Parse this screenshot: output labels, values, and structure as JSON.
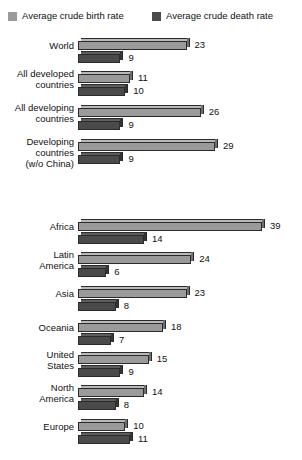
{
  "legend": {
    "items": [
      {
        "label": "Average crude birth rate",
        "color": "#9a9a9a",
        "key": "birth"
      },
      {
        "label": "Average crude death rate",
        "color": "#4a4a4a",
        "key": "death"
      }
    ]
  },
  "chart_data": {
    "type": "bar",
    "orientation": "horizontal",
    "title": "",
    "xlabel": "",
    "ylabel": "",
    "xlim": [
      0,
      39
    ],
    "grid": false,
    "legend_position": "top",
    "categories": [
      "World",
      "All developed\ncountries",
      "All developing\ncountries",
      "Developing\ncountries\n(w/o China)",
      "Africa",
      "Latin\nAmerica",
      "Asia",
      "Oceania",
      "United\nStates",
      "North\nAmerica",
      "Europe"
    ],
    "series": [
      {
        "name": "Average crude birth rate",
        "color": "#9a9a9a",
        "values": [
          23,
          11,
          26,
          29,
          39,
          24,
          23,
          18,
          15,
          14,
          10
        ]
      },
      {
        "name": "Average crude death rate",
        "color": "#4a4a4a",
        "values": [
          9,
          10,
          9,
          9,
          14,
          6,
          8,
          7,
          9,
          8,
          11
        ]
      }
    ],
    "groups": [
      {
        "name": "aggregates",
        "categories": [
          "World",
          "All developed\ncountries",
          "All developing\ncountries",
          "Developing\ncountries\n(w/o China)"
        ]
      },
      {
        "name": "regions",
        "categories": [
          "Africa",
          "Latin\nAmerica",
          "Asia",
          "Oceania",
          "United\nStates",
          "North\nAmerica",
          "Europe"
        ]
      }
    ]
  },
  "layout": {
    "rows": [
      {
        "label": "World",
        "top": 38,
        "label_top": 40,
        "birth": 23,
        "death": 9
      },
      {
        "label": "All developed\ncountries",
        "top": 71,
        "label_top": 68,
        "birth": 11,
        "death": 10
      },
      {
        "label": "All developing\ncountries",
        "top": 105,
        "label_top": 102,
        "birth": 26,
        "death": 9
      },
      {
        "label": "Developing\ncountries\n(w/o China)",
        "top": 139,
        "label_top": 136,
        "birth": 29,
        "death": 9
      },
      {
        "label": "Africa",
        "top": 219,
        "label_top": 221,
        "birth": 39,
        "death": 14
      },
      {
        "label": "Latin\nAmerica",
        "top": 252,
        "label_top": 249,
        "birth": 24,
        "death": 6
      },
      {
        "label": "Asia",
        "top": 286,
        "label_top": 288,
        "birth": 23,
        "death": 8
      },
      {
        "label": "Oceania",
        "top": 320,
        "label_top": 322,
        "birth": 18,
        "death": 7
      },
      {
        "label": "United\nStates",
        "top": 352,
        "label_top": 349,
        "birth": 15,
        "death": 9
      },
      {
        "label": "North\nAmerica",
        "top": 385,
        "label_top": 382,
        "birth": 14,
        "death": 8
      },
      {
        "label": "Europe",
        "top": 419,
        "label_top": 421,
        "birth": 10,
        "death": 11
      }
    ],
    "px_per_unit": 4.72
  }
}
